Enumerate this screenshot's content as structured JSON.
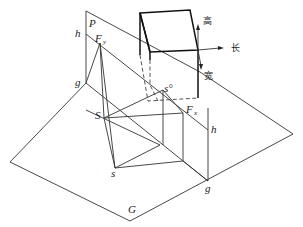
{
  "diagram": {
    "type": "shadow-projection perspective diagram",
    "planes": {
      "vertical_plane": "P",
      "ground_plane": "G"
    },
    "labels": {
      "P": "P",
      "G": "G",
      "h_left": "h",
      "h_right": "h",
      "g_left": "g",
      "g_right": "g",
      "Fy": "F",
      "Fy_sub": "y",
      "Fx": "F",
      "Fx_sub": "x",
      "S": "S",
      "s": "s",
      "s0": "s°"
    },
    "axes": {
      "height": "高",
      "length": "长",
      "width": "宽"
    },
    "colors": {
      "line": "#333333",
      "box": "#111111",
      "background": "#ffffff"
    }
  }
}
